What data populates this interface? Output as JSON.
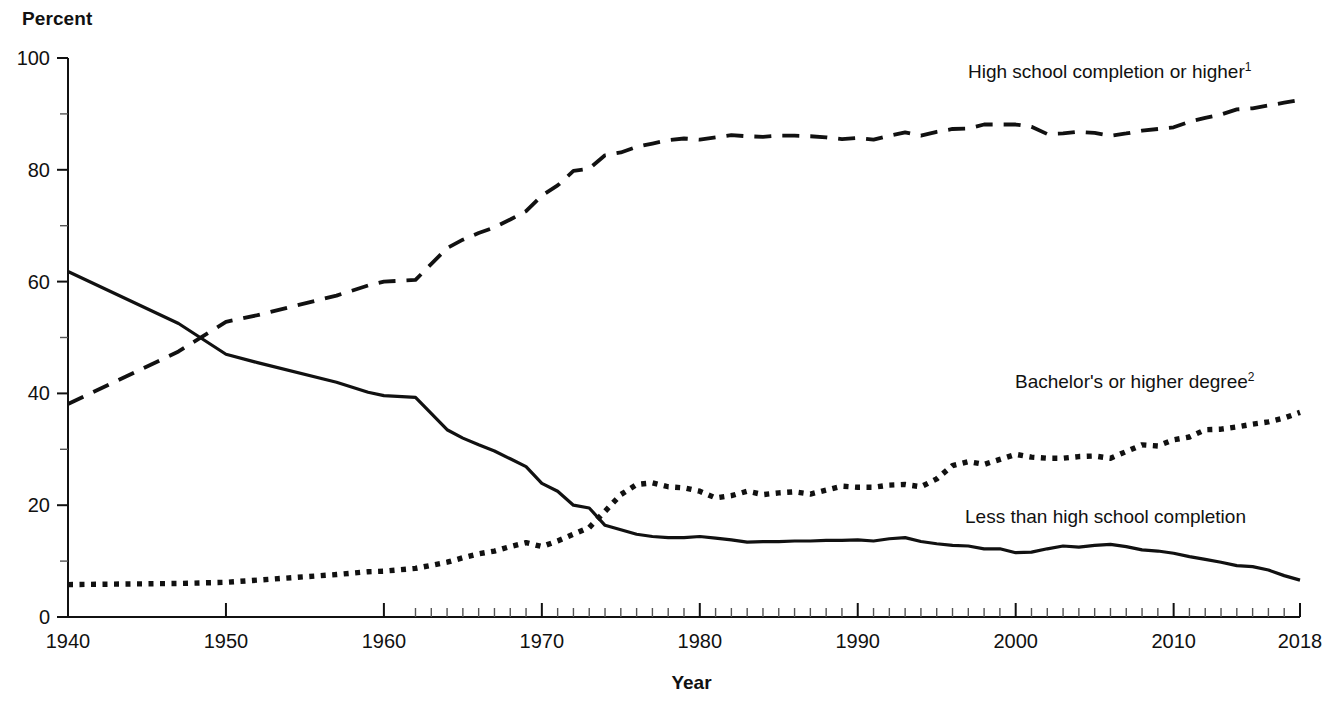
{
  "axis_title_y": "Percent",
  "axis_title_x": "Year",
  "legend": [
    {
      "text": "High school completion or higher",
      "sup": "1",
      "x": 968,
      "y": 78,
      "anchor": "start"
    },
    {
      "text": "Bachelor's or higher degree",
      "sup": "2",
      "x": 1015,
      "y": 388,
      "anchor": "start"
    },
    {
      "text": "Less than high school completion",
      "sup": "",
      "x": 965,
      "y": 523,
      "anchor": "start"
    }
  ],
  "chart_data": {
    "type": "line",
    "title": "",
    "xlabel": "Year",
    "ylabel": "Percent",
    "xlim": [
      1940,
      2018
    ],
    "ylim": [
      0,
      100
    ],
    "grid": false,
    "legend_position": "inline-right",
    "y_ticks_major": [
      0,
      20,
      40,
      60,
      80,
      100
    ],
    "y_ticks_minor": [
      10,
      30,
      50,
      70,
      90
    ],
    "x_ticks_major": [
      1940,
      1950,
      1960,
      1970,
      1980,
      1990,
      2000,
      2010
    ],
    "x_tick_end": 2018,
    "x_tick_labels": [
      "1940",
      "1950",
      "1960",
      "1970",
      "1980",
      "1990",
      "2000",
      "2010",
      "2018"
    ],
    "x_minor_start": 1962,
    "series": [
      {
        "name": "High school completion or higher",
        "style": "dashed",
        "footnote": "1",
        "x": [
          1940,
          1947,
          1950,
          1952,
          1957,
          1959,
          1960,
          1962,
          1964,
          1965,
          1966,
          1967,
          1968,
          1969,
          1970,
          1971,
          1972,
          1973,
          1974,
          1975,
          1976,
          1977,
          1978,
          1979,
          1980,
          1981,
          1982,
          1983,
          1984,
          1985,
          1986,
          1987,
          1988,
          1989,
          1990,
          1991,
          1992,
          1993,
          1994,
          1995,
          1996,
          1997,
          1998,
          1999,
          2000,
          2001,
          2002,
          2003,
          2004,
          2005,
          2006,
          2007,
          2008,
          2009,
          2010,
          2011,
          2012,
          2013,
          2014,
          2015,
          2016,
          2017,
          2018
        ],
        "y": [
          38.1,
          47.5,
          52.8,
          54.0,
          57.5,
          59.3,
          60.0,
          60.3,
          66.0,
          67.5,
          68.7,
          69.7,
          71.1,
          72.6,
          75.4,
          77.2,
          79.8,
          80.2,
          82.6,
          83.1,
          84.1,
          84.7,
          85.3,
          85.6,
          85.4,
          85.8,
          86.2,
          86.0,
          85.9,
          86.1,
          86.1,
          86.0,
          85.8,
          85.5,
          85.7,
          85.4,
          86.1,
          86.7,
          86.1,
          86.8,
          87.3,
          87.4,
          88.1,
          88.1,
          88.1,
          87.7,
          86.4,
          86.5,
          86.8,
          86.6,
          86.1,
          86.5,
          87.0,
          87.3,
          87.6,
          88.6,
          89.3,
          89.9,
          90.8,
          91.0,
          91.5,
          92.0,
          92.5
        ]
      },
      {
        "name": "Less than high school completion",
        "style": "solid",
        "footnote": "",
        "x": [
          1940,
          1947,
          1950,
          1952,
          1957,
          1959,
          1960,
          1962,
          1964,
          1965,
          1966,
          1967,
          1968,
          1969,
          1970,
          1971,
          1972,
          1973,
          1974,
          1975,
          1976,
          1977,
          1978,
          1979,
          1980,
          1981,
          1982,
          1983,
          1984,
          1985,
          1986,
          1987,
          1988,
          1989,
          1990,
          1991,
          1992,
          1993,
          1994,
          1995,
          1996,
          1997,
          1998,
          1999,
          2000,
          2001,
          2002,
          2003,
          2004,
          2005,
          2006,
          2007,
          2008,
          2009,
          2010,
          2011,
          2012,
          2013,
          2014,
          2015,
          2016,
          2017,
          2018
        ],
        "y": [
          61.8,
          52.5,
          47.0,
          45.5,
          42.0,
          40.2,
          39.6,
          39.3,
          33.5,
          32.0,
          30.8,
          29.7,
          28.3,
          26.9,
          23.9,
          22.5,
          20.0,
          19.5,
          16.4,
          15.6,
          14.8,
          14.4,
          14.2,
          14.2,
          14.4,
          14.1,
          13.8,
          13.4,
          13.5,
          13.5,
          13.6,
          13.6,
          13.7,
          13.7,
          13.8,
          13.6,
          14.0,
          14.2,
          13.5,
          13.1,
          12.8,
          12.7,
          12.2,
          12.2,
          11.5,
          11.6,
          12.2,
          12.7,
          12.5,
          12.8,
          13.0,
          12.6,
          12.0,
          11.8,
          11.4,
          10.8,
          10.3,
          9.8,
          9.2,
          9.0,
          8.4,
          7.4,
          6.6
        ]
      },
      {
        "name": "Bachelor's or higher degree",
        "style": "dotted",
        "footnote": "2",
        "x": [
          1940,
          1947,
          1950,
          1952,
          1957,
          1959,
          1960,
          1962,
          1964,
          1965,
          1966,
          1967,
          1968,
          1969,
          1970,
          1971,
          1972,
          1973,
          1974,
          1975,
          1976,
          1977,
          1978,
          1979,
          1980,
          1981,
          1982,
          1983,
          1984,
          1985,
          1986,
          1987,
          1988,
          1989,
          1990,
          1991,
          1992,
          1993,
          1994,
          1995,
          1996,
          1997,
          1998,
          1999,
          2000,
          2001,
          2002,
          2003,
          2004,
          2005,
          2006,
          2007,
          2008,
          2009,
          2010,
          2011,
          2012,
          2013,
          2014,
          2015,
          2016,
          2017,
          2018
        ],
        "y": [
          5.8,
          6.0,
          6.2,
          6.6,
          7.6,
          8.1,
          8.2,
          8.7,
          9.8,
          10.6,
          11.3,
          11.8,
          12.6,
          13.3,
          12.6,
          13.6,
          14.8,
          16.0,
          18.9,
          21.9,
          23.7,
          24.0,
          23.3,
          23.1,
          22.5,
          21.3,
          21.7,
          22.5,
          21.9,
          22.2,
          22.4,
          22.0,
          22.7,
          23.4,
          23.2,
          23.2,
          23.6,
          23.7,
          23.3,
          24.7,
          27.1,
          27.8,
          27.3,
          28.2,
          29.1,
          28.6,
          28.4,
          28.4,
          28.7,
          28.8,
          28.4,
          29.6,
          30.8,
          30.6,
          31.7,
          32.2,
          33.5,
          33.6,
          34.0,
          34.5,
          34.9,
          35.6,
          36.6
        ]
      }
    ]
  },
  "geometry": {
    "plot_left": 68,
    "plot_right": 1300,
    "plot_top": 58,
    "plot_bottom": 617
  }
}
